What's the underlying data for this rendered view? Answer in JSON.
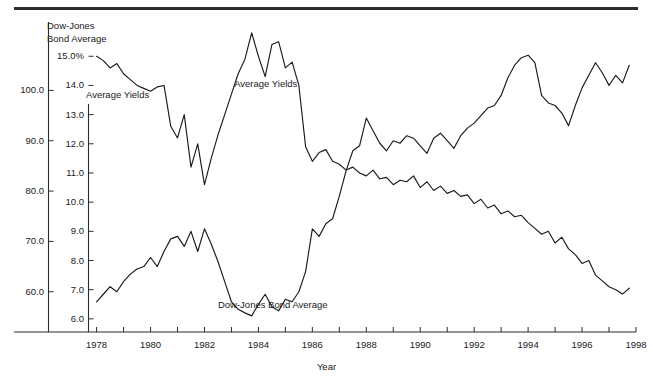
{
  "figure": {
    "top_rule": "horizontal-rule"
  },
  "chart_data": {
    "type": "line",
    "title": "Dow-Jones Bond Average",
    "subtitle": "Average Yields",
    "xlabel": "Year",
    "ylabel_left_outer": "Dow-Jones Bond Average",
    "ylabel_left_inner": "Average Yields",
    "grid": false,
    "legend_position": "inline-annotations",
    "xlim": [
      1977.7,
      1998.0
    ],
    "xticks_labeled": [
      "1978",
      "1980",
      "1982",
      "1984",
      "1986",
      "1988",
      "1990",
      "1992",
      "1994",
      "1996",
      "1998"
    ],
    "xticks_values": [
      1978,
      1980,
      1982,
      1984,
      1986,
      1988,
      1990,
      1992,
      1994,
      1996,
      1998
    ],
    "xticks_minor_step": 1,
    "axes": [
      {
        "name": "outer-axis-bond-average",
        "ylim": [
          52.0,
          112.0
        ],
        "ticks": [
          "100.0",
          "90.0",
          "80.0",
          "70.0",
          "60.0"
        ],
        "tick_values": [
          100.0,
          90.0,
          80.0,
          70.0,
          60.0
        ]
      },
      {
        "name": "inner-axis-average-yields",
        "ylim": [
          5.55,
          15.9
        ],
        "ticks": [
          "15.0%",
          "14.0",
          "13.0",
          "12.0",
          "11.0",
          "10.0",
          "9.0",
          "8.0",
          "7.0",
          "6.0"
        ],
        "tick_values": [
          15.0,
          14.0,
          13.0,
          12.0,
          11.0,
          10.0,
          9.0,
          8.0,
          7.0,
          6.0
        ]
      }
    ],
    "annotations": [
      {
        "text": "Average Yields",
        "x": 1983.1,
        "y_axis": "inner",
        "y": 14.05
      },
      {
        "text": "Dow-Jones Bond Average",
        "x": 1982.5,
        "y_axis": "outer",
        "y": 57.4
      }
    ],
    "series": [
      {
        "name": "Average Yields",
        "axis": "inner",
        "unit": "%",
        "x": [
          1978.0,
          1978.25,
          1978.5,
          1978.75,
          1979.0,
          1979.25,
          1979.5,
          1979.75,
          1980.0,
          1980.25,
          1980.5,
          1980.75,
          1981.0,
          1981.25,
          1981.5,
          1981.75,
          1982.0,
          1982.25,
          1982.5,
          1982.75,
          1983.0,
          1983.25,
          1983.5,
          1983.75,
          1984.0,
          1984.25,
          1984.5,
          1984.75,
          1985.0,
          1985.25,
          1985.5,
          1985.75,
          1986.0,
          1986.25,
          1986.5,
          1986.75,
          1987.0,
          1987.25,
          1987.5,
          1987.75,
          1988.0,
          1988.25,
          1988.5,
          1988.75,
          1989.0,
          1989.25,
          1989.5,
          1989.75,
          1990.0,
          1990.25,
          1990.5,
          1990.75,
          1991.0,
          1991.25,
          1991.5,
          1991.75,
          1992.0,
          1992.25,
          1992.5,
          1992.75,
          1993.0,
          1993.25,
          1993.5,
          1993.75,
          1994.0,
          1994.25,
          1994.5,
          1994.75,
          1995.0,
          1995.25,
          1995.5,
          1995.75,
          1996.0,
          1996.25,
          1996.5,
          1996.75,
          1997.0,
          1997.25,
          1997.5,
          1997.75
        ],
        "values": [
          15.0,
          14.85,
          14.6,
          14.75,
          14.4,
          14.2,
          14.0,
          13.9,
          13.8,
          13.95,
          14.0,
          12.6,
          12.2,
          13.0,
          11.2,
          12.0,
          10.6,
          11.5,
          12.3,
          13.0,
          13.7,
          14.4,
          14.9,
          15.8,
          15.0,
          14.3,
          15.4,
          15.5,
          14.6,
          14.8,
          14.0,
          11.9,
          11.4,
          11.7,
          11.8,
          11.4,
          11.3,
          11.1,
          11.2,
          11.0,
          10.9,
          11.1,
          10.8,
          10.85,
          10.6,
          10.75,
          10.7,
          10.9,
          10.5,
          10.7,
          10.4,
          10.55,
          10.3,
          10.4,
          10.2,
          10.25,
          9.95,
          10.1,
          9.8,
          9.9,
          9.6,
          9.7,
          9.5,
          9.55,
          9.3,
          9.1,
          8.9,
          9.0,
          8.6,
          8.8,
          8.4,
          8.2,
          7.9,
          8.0,
          7.5,
          7.3,
          7.1,
          7.0,
          6.85,
          7.05
        ]
      },
      {
        "name": "Dow-Jones Bond Average",
        "axis": "outer",
        "unit": "",
        "x": [
          1978.0,
          1978.25,
          1978.5,
          1978.75,
          1979.0,
          1979.25,
          1979.5,
          1979.75,
          1980.0,
          1980.25,
          1980.5,
          1980.75,
          1981.0,
          1981.25,
          1981.5,
          1981.75,
          1982.0,
          1982.25,
          1982.5,
          1982.75,
          1983.0,
          1983.25,
          1983.5,
          1983.75,
          1984.0,
          1984.25,
          1984.5,
          1984.75,
          1985.0,
          1985.25,
          1985.5,
          1985.75,
          1986.0,
          1986.25,
          1986.5,
          1986.75,
          1987.0,
          1987.25,
          1987.5,
          1987.75,
          1988.0,
          1988.25,
          1988.5,
          1988.75,
          1989.0,
          1989.25,
          1989.5,
          1989.75,
          1990.0,
          1990.25,
          1990.5,
          1990.75,
          1991.0,
          1991.25,
          1991.5,
          1991.75,
          1992.0,
          1992.25,
          1992.5,
          1992.75,
          1993.0,
          1993.25,
          1993.5,
          1993.75,
          1994.0,
          1994.25,
          1994.5,
          1994.75,
          1995.0,
          1995.25,
          1995.5,
          1995.75,
          1996.0,
          1996.25,
          1996.5,
          1996.75,
          1997.0,
          1997.25,
          1997.5,
          1997.75
        ],
        "values": [
          58.0,
          59.5,
          61.0,
          60.0,
          62.0,
          63.5,
          64.5,
          65.0,
          66.8,
          65.0,
          68.0,
          70.5,
          71.0,
          69.0,
          72.0,
          68.0,
          72.5,
          69.5,
          66.0,
          62.0,
          58.0,
          56.5,
          55.8,
          55.2,
          57.5,
          59.5,
          57.0,
          56.2,
          58.5,
          58.0,
          60.0,
          64.0,
          72.5,
          71.0,
          73.5,
          74.5,
          79.0,
          84.0,
          88.0,
          89.0,
          94.5,
          92.0,
          89.5,
          88.0,
          90.0,
          89.5,
          91.0,
          90.5,
          89.0,
          87.5,
          90.5,
          91.5,
          90.0,
          88.5,
          91.0,
          92.5,
          93.5,
          95.0,
          96.5,
          97.0,
          99.0,
          102.5,
          105.0,
          106.5,
          107.0,
          105.5,
          99.0,
          97.5,
          97.0,
          95.5,
          93.0,
          97.0,
          100.5,
          103.0,
          105.5,
          103.5,
          101.0,
          103.0,
          101.5,
          105.0
        ]
      }
    ]
  }
}
